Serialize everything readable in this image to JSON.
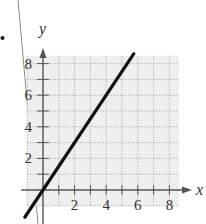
{
  "chart_data": {
    "type": "line",
    "title": "",
    "xlabel": "x",
    "ylabel": "y",
    "xlim": [
      -1,
      8.6
    ],
    "ylim": [
      -1,
      8.5
    ],
    "grid": true,
    "grid_style": "dotted",
    "x_ticks": [
      2,
      4,
      6,
      8
    ],
    "y_ticks": [
      2,
      4,
      6,
      8
    ],
    "x_minor_ticks": [
      1,
      2,
      3,
      4,
      5,
      6,
      7,
      8
    ],
    "y_minor_ticks": [
      1,
      2,
      3,
      4,
      5,
      6,
      7,
      8
    ],
    "legend": null,
    "series": [
      {
        "name": "y = 1.5x",
        "slope": 1.5,
        "intercept": 0,
        "x": [
          -1.15,
          5.75
        ],
        "y": [
          -1.725,
          8.625
        ],
        "color": "#111111"
      }
    ],
    "colors": {
      "plot_background": "#efefef",
      "grid": "#9a9a9a",
      "axes": "#555555",
      "line": "#111111",
      "margin_line": "#8a8a8a",
      "bullet": "#111111"
    }
  },
  "labels": {
    "x_axis": "x",
    "y_axis": "y",
    "x_tick_labels": [
      "2",
      "4",
      "6",
      "8"
    ],
    "y_tick_labels": [
      "2",
      "4",
      "6",
      "8"
    ]
  }
}
